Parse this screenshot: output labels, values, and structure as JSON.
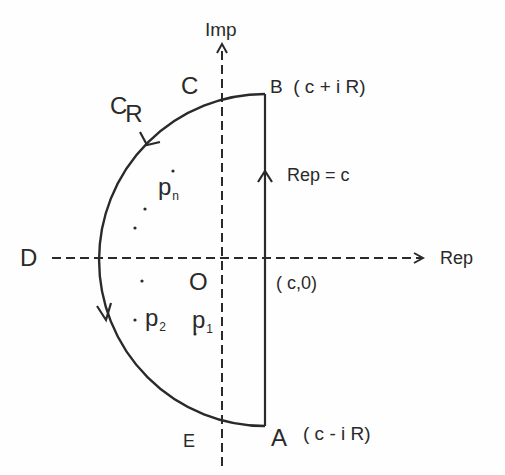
{
  "diagram": {
    "axes": {
      "vertical_label": "Imp",
      "horizontal_label": "Rep",
      "origin_label": "O"
    },
    "points": {
      "A": {
        "label": "A",
        "coord": "( c - i R)"
      },
      "B": {
        "label": "B",
        "coord": "( c + i R)"
      },
      "C": {
        "label": "C"
      },
      "D": {
        "label": "D"
      },
      "E": {
        "label": "E"
      },
      "c0": {
        "label": "( c,0)"
      }
    },
    "contour": {
      "arc_label_main": "C",
      "arc_label_sub": "R",
      "line_label": "Rep = c"
    },
    "poles": {
      "p1": {
        "main": "p",
        "sub": "1"
      },
      "p2": {
        "main": "p",
        "sub": "2"
      },
      "pn": {
        "main": "p",
        "sub": "n"
      }
    },
    "colors": {
      "stroke": "#2a2a2a",
      "background": "#fefefe"
    }
  }
}
